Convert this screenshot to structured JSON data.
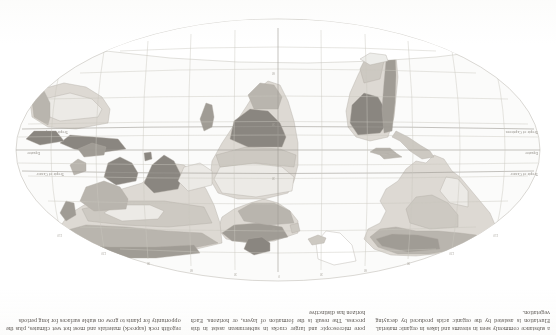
{
  "page": {
    "orientation": "rotated-180",
    "kind": "textbook-page-scan"
  },
  "columns": [
    {
      "id": "column-left",
      "lines": [
        "a substance commonly seen in streams and lakes",
        "in organic material. Eluviation is assisted by the",
        "organic acids produced by decaying vegetation."
      ],
      "text": "a substance commonly seen in streams and lakes in organic material. Eluviation is assisted by the organic acids produced by decaying vegetation."
    },
    {
      "id": "column-middle",
      "lines": [
        "pore microscopic and larger cracks in subterranean",
        "assist in this process. The result is the formation",
        "of layers, or horizons. Each horizon has distinctive"
      ],
      "text": "pore microscopic and larger cracks in subterranean assist in this process. The result is the formation of layers, or horizons. Each horizon has distinctive"
    },
    {
      "id": "column-right",
      "lines": [
        "regolith rock (saprock) materials and most",
        "hot wet climates, plus the opportunity for",
        "plants to grow on stable surfaces for long periods"
      ],
      "text": "regolith rock (saprock) materials and most hot wet climates, plus the opportunity for plants to grow on stable surfaces for long periods"
    }
  ],
  "map": {
    "projection": "oval / Mollweide-like world projection",
    "latitude_labels": [
      {
        "name": "tropic-of-cancer",
        "label": "Tropic of Cancer",
        "lat": 23.5
      },
      {
        "name": "equator",
        "label": "Equator",
        "lat": 0
      },
      {
        "name": "tropic-of-capricorn",
        "label": "Tropic of Capricorn",
        "lat": -23.5
      }
    ],
    "longitude_labels": [
      "150",
      "120",
      "90",
      "60",
      "30",
      "0",
      "30",
      "60",
      "90",
      "120",
      "150"
    ],
    "latitude_tick_labels": [
      "60",
      "30",
      "0",
      "30",
      "60"
    ],
    "colors": {
      "ocean": "#fbfbfa",
      "graticule": "#c9c6bf",
      "outline": "#b6b2aa",
      "land_tone_1": "#eceae6",
      "land_tone_2": "#ddd9d3",
      "land_tone_3": "#cdc9c2",
      "land_tone_4": "#b9b5ae",
      "land_tone_5": "#a09c95",
      "land_tone_6": "#8a8680",
      "ice": "#ffffff",
      "paper": "#ffffff"
    }
  }
}
